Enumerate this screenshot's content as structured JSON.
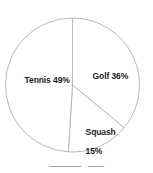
{
  "chart_data": {
    "type": "pie",
    "title": "",
    "subtitle": "",
    "xlabel": "",
    "ylabel": "",
    "legend_position": "none",
    "grid": false,
    "labels_inside_slices": true,
    "start_angle_deg_from_top": 0,
    "direction": "clockwise",
    "categories": [
      "Golf",
      "Squash",
      "Tennis"
    ],
    "values": [
      36,
      15,
      49
    ],
    "unit": "%",
    "slices": [
      {
        "name": "Golf",
        "value": 36,
        "value_text": "36%",
        "label": "Golf 36%",
        "sweep_deg": 129.6,
        "start_deg": 0,
        "end_deg": 129.6,
        "fill": "#ffffff",
        "stroke": "#b9b9b9"
      },
      {
        "name": "Squash",
        "value": 15,
        "value_text": "15%",
        "label": "Squash 15%",
        "label_line1": "Squash",
        "label_line2": "15%",
        "sweep_deg": 54,
        "start_deg": 129.6,
        "end_deg": 183.6,
        "fill": "#ffffff",
        "stroke": "#b9b9b9"
      },
      {
        "name": "Tennis",
        "value": 49,
        "value_text": "49%",
        "label": "Tennis 49%",
        "sweep_deg": 176.4,
        "start_deg": 183.6,
        "end_deg": 360,
        "fill": "#ffffff",
        "stroke": "#b9b9b9"
      }
    ]
  },
  "chart": {
    "center_x": 72.5,
    "center_y": 85,
    "radius": 67,
    "outline_color": "#b9b9b9",
    "background": "#ffffff",
    "label_color": "#1d1d1d"
  },
  "labels": {
    "tennis": "Tennis 49%",
    "golf": "Golf 36%",
    "squash_line1": "Squash",
    "squash_line2": "15%"
  },
  "caption": {
    "clipped_text": "————   ——",
    "note": "cut off at bottom edge, illegible"
  }
}
